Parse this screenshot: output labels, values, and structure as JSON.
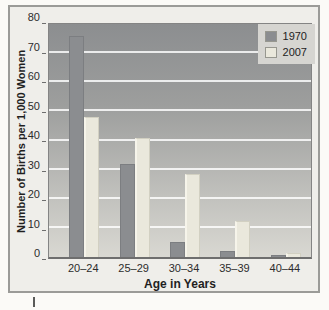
{
  "chart_data": {
    "type": "bar",
    "categories": [
      "20–24",
      "25–29",
      "30–34",
      "35–39",
      "40–44"
    ],
    "series": [
      {
        "name": "1970",
        "color": "#8b8d90",
        "values": [
          76,
          32,
          5,
          2,
          0.7
        ]
      },
      {
        "name": "2007",
        "color": "#eae8dc",
        "values": [
          48,
          41,
          28.5,
          12.5,
          1.5
        ]
      }
    ],
    "xlabel": "Age in Years",
    "ylabel": "Number of Births per 1,000 Women",
    "ylim": [
      0,
      80
    ],
    "yticks": [
      0,
      10,
      20,
      30,
      40,
      50,
      60,
      70,
      80
    ],
    "grid": true,
    "gridline_color": "#ffffff",
    "plot_bg_top": "#8c8e90",
    "plot_bg_bottom": "#d9d8d2",
    "legend_position": "top-right"
  },
  "legend": {
    "items": [
      {
        "label": "1970"
      },
      {
        "label": "2007"
      }
    ]
  },
  "axes": {
    "x_title": "Age in Years",
    "y_title": "Number of Births per 1,000 Women"
  }
}
